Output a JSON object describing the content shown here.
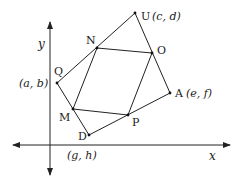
{
  "diagram": {
    "type": "coordinate-geometry",
    "axes": {
      "x_label": "x",
      "y_label": "y",
      "origin": [
        50,
        145
      ],
      "x_axis": {
        "from": [
          13,
          145
        ],
        "to": [
          230,
          145
        ]
      },
      "y_axis": {
        "from": [
          50,
          175
        ],
        "to": [
          50,
          22
        ]
      }
    },
    "points": [
      {
        "id": "Q",
        "label": "Q",
        "coord_label": "(a, b)",
        "pos": [
          57,
          83
        ]
      },
      {
        "id": "U",
        "label": "U",
        "coord_label": "(c, d)",
        "pos": [
          135,
          13
        ]
      },
      {
        "id": "A",
        "label": "A",
        "coord_label": "(e, f)",
        "pos": [
          170,
          93
        ]
      },
      {
        "id": "D",
        "label": "D",
        "coord_label": "(g, h)",
        "pos": [
          89,
          135
        ]
      },
      {
        "id": "N",
        "label": "N",
        "coord_label": "",
        "pos": [
          97,
          48
        ]
      },
      {
        "id": "O",
        "label": "O",
        "coord_label": "",
        "pos": [
          152,
          53
        ]
      },
      {
        "id": "P",
        "label": "P",
        "coord_label": "",
        "pos": [
          128,
          115
        ]
      },
      {
        "id": "M",
        "label": "M",
        "coord_label": "",
        "pos": [
          73,
          109
        ]
      }
    ],
    "outer_quadrilateral": [
      "Q",
      "U",
      "A",
      "D"
    ],
    "inner_quadrilateral": [
      "N",
      "O",
      "P",
      "M"
    ],
    "labels": {
      "Q": "Q",
      "Q_coord": "(a, b)",
      "U": "U",
      "U_coord": "(c, d)",
      "A": "A",
      "A_coord": "(e, f)",
      "D": "D",
      "D_coord": "(g, h)",
      "N": "N",
      "O": "O",
      "P": "P",
      "M": "M",
      "x": "x",
      "y": "y"
    },
    "colors": {
      "line": "#222222",
      "background": "#ffffff",
      "text": "#1a1a1a"
    }
  }
}
